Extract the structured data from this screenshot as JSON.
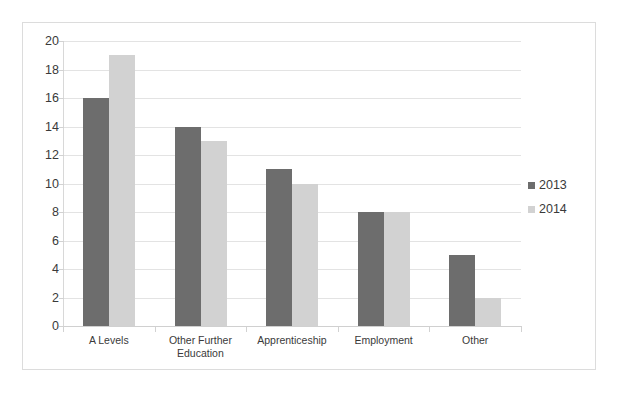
{
  "chart_data": {
    "type": "bar",
    "title": "",
    "xlabel": "",
    "ylabel": "",
    "ylim": [
      0,
      20
    ],
    "ytick_step": 2,
    "yticks": [
      20,
      18,
      16,
      14,
      12,
      10,
      8,
      6,
      4,
      2,
      0
    ],
    "grid": true,
    "legend_position": "right",
    "categories": [
      "A Levels",
      "Other Further\nEducation",
      "Apprenticeship",
      "Employment",
      "Other"
    ],
    "series": [
      {
        "name": "2013",
        "color": "#6d6d6d",
        "values": [
          16,
          14,
          11,
          8,
          5
        ]
      },
      {
        "name": "2014",
        "color": "#d2d2d2",
        "values": [
          19,
          13,
          10,
          8,
          2
        ]
      }
    ]
  },
  "legend": {
    "items": [
      {
        "label": "2013",
        "color": "#6d6d6d"
      },
      {
        "label": "2014",
        "color": "#d2d2d2"
      }
    ]
  },
  "colors": {
    "series_2013": "#6d6d6d",
    "series_2014": "#d2d2d2",
    "gridline": "#e3e3e3",
    "axis": "#d0d0d0",
    "frame_border": "#dcdcdc",
    "text": "#3a3a3a",
    "background": "#ffffff"
  }
}
